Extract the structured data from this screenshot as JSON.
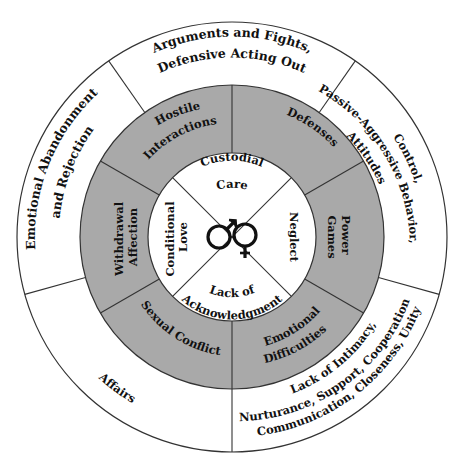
{
  "diagram": {
    "colors": {
      "ring_fill": "#a9a9a9",
      "line": "#333333",
      "background": "#ffffff",
      "text": "#111111"
    },
    "center_icon": "male-female-symbols-icon",
    "inner_circle": [
      {
        "id": "custodial-care",
        "lines": [
          "Custodial",
          "Care"
        ]
      },
      {
        "id": "neglect",
        "lines": [
          "Neglect"
        ]
      },
      {
        "id": "lack-of-acknowledgment",
        "lines": [
          "Lack of",
          "Acknowledgment"
        ]
      },
      {
        "id": "conditional-love",
        "lines": [
          "Conditional",
          "Love"
        ]
      }
    ],
    "middle_ring": [
      {
        "id": "hostile-interactions",
        "lines": [
          "Hostile",
          "Interactions"
        ]
      },
      {
        "id": "defenses",
        "lines": [
          "Defenses"
        ]
      },
      {
        "id": "power-games",
        "lines": [
          "Power",
          "Games"
        ]
      },
      {
        "id": "emotional-difficulties",
        "lines": [
          "Emotional",
          "Difficulties"
        ]
      },
      {
        "id": "sexual-conflict",
        "lines": [
          "Sexual Conflict"
        ]
      },
      {
        "id": "withdrawal-affection",
        "lines": [
          "Withdrawal",
          "Affection"
        ]
      }
    ],
    "outer_ring": [
      {
        "id": "arguments-fights",
        "lines": [
          "Arguments and Fights,",
          "Defensive Acting Out"
        ]
      },
      {
        "id": "control",
        "lines": [
          "Control,",
          "Passive-Aggressive Behavior,",
          "Attitudes"
        ]
      },
      {
        "id": "lack-of-intimacy",
        "lines": [
          "Lack of Intimacy,",
          "Nurturance, Support, Cooperation,",
          "Communication, Closeness, Unity"
        ]
      },
      {
        "id": "affairs",
        "lines": [
          "Affairs"
        ]
      },
      {
        "id": "emotional-abandonment",
        "lines": [
          "Emotional Abandonment",
          "and Rejection"
        ]
      }
    ]
  }
}
